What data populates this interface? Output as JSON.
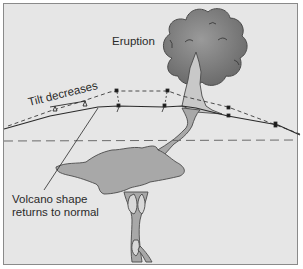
{
  "diagram": {
    "type": "volcano cross-section",
    "labels": {
      "eruption": "Eruption",
      "tilt": "Tilt decreases",
      "shape_line1": "Volcano shape",
      "shape_line2": "returns to normal"
    },
    "elements": {
      "eruption_cloud": "eruption-cloud",
      "eruption_column": "eruption-column",
      "magma_chamber": "magma-chamber",
      "conduit": "magma-conduit",
      "ground_surface": "deflated-ground-surface",
      "inflated_surface": "inflated-surface-dashed",
      "reference_line": "reference-level-dashed",
      "tiltmeter": "tiltmeter",
      "survey_markers": "survey-markers"
    },
    "colors": {
      "background": "#e6e6e6",
      "cloud_fill": "#7a7a7a",
      "magma_fill": "#a8a8a8",
      "column_fill": "#c8c8c8",
      "line": "#2a2a2a",
      "border": "#8a8a8a"
    }
  }
}
